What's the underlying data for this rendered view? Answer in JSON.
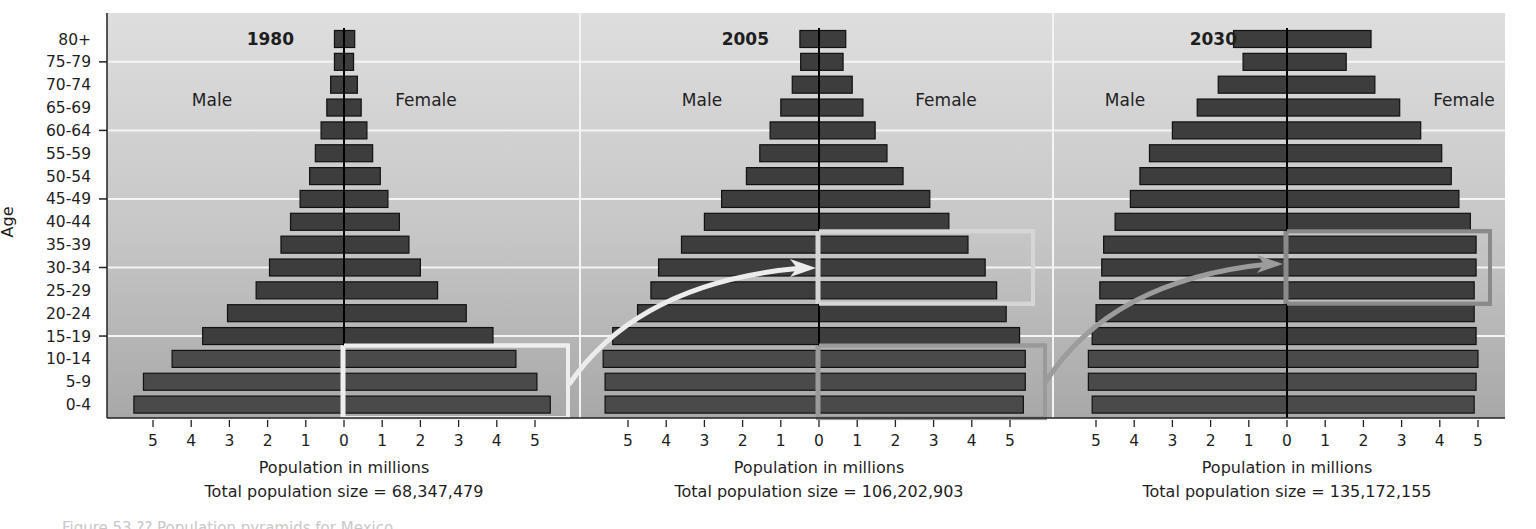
{
  "figure": {
    "y_axis_label": "Age",
    "x_axis_label": "Population in millions",
    "caption_partial": "Figure 53.?? Population pyramids for Mexico"
  },
  "chart_data": {
    "type": "bar",
    "subtype": "population-pyramid",
    "categories": [
      "80+",
      "75-79",
      "70-74",
      "65-69",
      "60-64",
      "55-59",
      "50-54",
      "45-49",
      "40-44",
      "35-39",
      "30-34",
      "25-29",
      "20-24",
      "15-19",
      "10-14",
      "5-9",
      "0-4"
    ],
    "ylabel": "Age",
    "xlabel": "Population in millions",
    "x_ticks": [
      5,
      4,
      3,
      2,
      1,
      0,
      1,
      2,
      3,
      4,
      5
    ],
    "xlim": [
      -5.7,
      5.7
    ],
    "gridlines_at": [
      "75-79",
      "60-64",
      "45-49",
      "30-34",
      "15-19"
    ],
    "colors": {
      "background_top": "#dcdcdc",
      "background_bottom": "#a9a9a9",
      "bar_upper": "#3d3d3d",
      "bar_lower": "#4a4a4a",
      "bar_outline": "#111111",
      "gridline": "#f4f4f4",
      "highlight_1980": "#eeeeee",
      "highlight_2005": "#9a9a9a",
      "highlight_2030": "#8a8a8a"
    },
    "panels": [
      {
        "year": "1980",
        "male_label": "Male",
        "female_label": "Female",
        "total_label": "Total population size = 68,347,479",
        "series": [
          {
            "name": "Male",
            "values": [
              0.25,
              0.25,
              0.35,
              0.45,
              0.6,
              0.75,
              0.9,
              1.15,
              1.4,
              1.65,
              1.95,
              2.3,
              3.05,
              3.7,
              4.5,
              5.25,
              5.5
            ]
          },
          {
            "name": "Female",
            "values": [
              0.28,
              0.25,
              0.35,
              0.45,
              0.6,
              0.75,
              0.95,
              1.15,
              1.45,
              1.7,
              2.0,
              2.45,
              3.2,
              3.9,
              4.5,
              5.05,
              5.4
            ]
          }
        ],
        "highlight": {
          "ages": [
            "10-14",
            "5-9",
            "0-4"
          ],
          "side": "Female"
        }
      },
      {
        "year": "2005",
        "male_label": "Male",
        "female_label": "Female",
        "total_label": "Total population size = 106,202,903",
        "series": [
          {
            "name": "Male",
            "values": [
              0.5,
              0.48,
              0.7,
              1.0,
              1.28,
              1.55,
              1.9,
              2.55,
              3.0,
              3.6,
              4.2,
              4.4,
              4.75,
              5.4,
              5.65,
              5.6,
              5.6
            ]
          },
          {
            "name": "Female",
            "values": [
              0.7,
              0.63,
              0.87,
              1.15,
              1.47,
              1.78,
              2.2,
              2.9,
              3.4,
              3.9,
              4.35,
              4.65,
              4.9,
              5.25,
              5.4,
              5.4,
              5.35
            ]
          }
        ],
        "highlight": {
          "ages": [
            "35-39",
            "30-34",
            "25-29"
          ],
          "side": "Female",
          "arrow_from": "1980 ages 0-14"
        },
        "highlight2": {
          "ages": [
            "10-14",
            "5-9",
            "0-4"
          ],
          "side": "Female"
        }
      },
      {
        "year": "2030",
        "male_label": "Male",
        "female_label": "Female",
        "total_label": "Total population size = 135,172,155",
        "series": [
          {
            "name": "Male",
            "values": [
              1.4,
              1.15,
              1.8,
              2.35,
              3.0,
              3.6,
              3.85,
              4.1,
              4.5,
              4.8,
              4.85,
              4.9,
              5.0,
              5.1,
              5.2,
              5.2,
              5.1
            ]
          },
          {
            "name": "Female",
            "values": [
              2.2,
              1.55,
              2.3,
              2.95,
              3.5,
              4.05,
              4.3,
              4.5,
              4.8,
              4.95,
              4.95,
              4.9,
              4.9,
              4.95,
              5.0,
              4.95,
              4.9
            ]
          }
        ],
        "highlight": {
          "ages": [
            "35-39",
            "30-34",
            "25-29"
          ],
          "side": "Female",
          "arrow_from": "2005 ages 0-14"
        }
      }
    ]
  }
}
